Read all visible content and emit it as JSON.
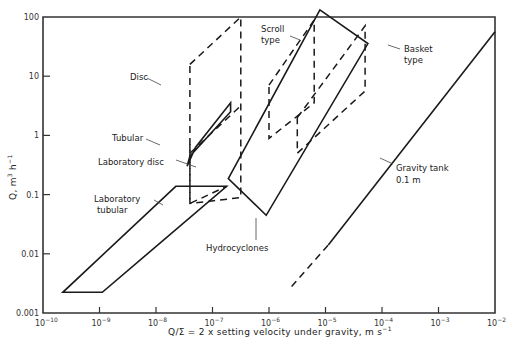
{
  "chart_data": {
    "type": "line",
    "title": "",
    "xlabel": "Q/Σ = 2 x setting velocity under gravity,  m s⁻¹",
    "ylabel": "Q,  m³ h⁻¹",
    "xscale": "log",
    "yscale": "log",
    "xlim": [
      1e-10,
      0.01
    ],
    "ylim": [
      0.001,
      100
    ],
    "grid": false,
    "x_tick_labels": [
      "10⁻¹⁰",
      "10⁻⁹",
      "10⁻⁸",
      "10⁻⁷",
      "10⁻⁶",
      "10⁻⁵",
      "10⁻⁴",
      "10⁻³",
      "10⁻²"
    ],
    "y_tick_labels": [
      "0.001",
      "0.01",
      "0.1",
      "1",
      "10",
      "100"
    ],
    "series": [
      {
        "name": "Laboratory tubular",
        "style": "solid",
        "closed": true,
        "points_log": [
          [
            -9.65,
            -2.65
          ],
          [
            -8.95,
            -2.65
          ],
          [
            -6.75,
            -0.86
          ],
          [
            -7.65,
            -0.86
          ]
        ]
      },
      {
        "name": "Laboratory disc",
        "style": "dashed",
        "closed": false,
        "points_log": [
          [
            -7.4,
            -0.15
          ],
          [
            -7.4,
            -1.15
          ],
          [
            -6.75,
            -0.86
          ]
        ]
      },
      {
        "name": "Hydrocyclones",
        "style": "solid",
        "closed": true,
        "points_log": [
          [
            -6.72,
            -0.73
          ],
          [
            -5.1,
            2.12
          ],
          [
            -4.25,
            1.55
          ],
          [
            -6.05,
            -1.35
          ]
        ]
      },
      {
        "name": "Tubular",
        "style": "solid",
        "closed": true,
        "points_log": [
          [
            -7.45,
            -0.52
          ],
          [
            -7.3,
            -0.2
          ],
          [
            -6.68,
            0.55
          ],
          [
            -6.68,
            0.4
          ],
          [
            -7.4,
            -0.35
          ],
          [
            -7.45,
            -0.52
          ]
        ]
      },
      {
        "name": "Disc",
        "style": "dashed",
        "closed": true,
        "points_log": [
          [
            -7.4,
            1.2
          ],
          [
            -6.5,
            2.0
          ],
          [
            -6.5,
            -1.05
          ],
          [
            -7.4,
            -1.15
          ]
        ]
      },
      {
        "name": "Disc (inner)",
        "style": "dashed",
        "closed": false,
        "points_log": [
          [
            -7.4,
            -0.3
          ],
          [
            -6.5,
            0.5
          ]
        ]
      },
      {
        "name": "Scroll type",
        "style": "dashed",
        "closed": true,
        "points_log": [
          [
            -6.0,
            0.85
          ],
          [
            -5.2,
            1.95
          ],
          [
            -5.2,
            0.55
          ],
          [
            -6.0,
            -0.05
          ]
        ]
      },
      {
        "name": "Basket type",
        "style": "dashed",
        "closed": true,
        "points_log": [
          [
            -5.5,
            0.3
          ],
          [
            -4.3,
            1.85
          ],
          [
            -4.3,
            0.75
          ],
          [
            -5.5,
            -0.3
          ]
        ]
      },
      {
        "name": "Gravity tank 0.1 m",
        "style": "solid",
        "closed": false,
        "points_log": [
          [
            -4.95,
            -1.85
          ],
          [
            -2.0,
            1.75
          ]
        ]
      },
      {
        "name": "Gravity tank 0.1 m (extension)",
        "style": "dashed",
        "closed": false,
        "points_log": [
          [
            -5.6,
            -2.55
          ],
          [
            -4.95,
            -1.85
          ]
        ]
      }
    ],
    "annotations": [
      {
        "text": "Disc",
        "x": 130,
        "y": 80,
        "lx1": 147,
        "ly1": 78,
        "lx2": 161,
        "ly2": 85
      },
      {
        "text": "Tubular",
        "x": 112,
        "y": 141,
        "lx1": 146,
        "ly1": 139,
        "lx2": 160,
        "ly2": 145
      },
      {
        "text": "Laboratory disc",
        "x": 98,
        "y": 165,
        "lx1": 176,
        "ly1": 160,
        "lx2": 196,
        "ly2": 167
      },
      {
        "text": "Laboratory",
        "x": 94,
        "y": 202,
        "lx1": 154,
        "ly1": 200,
        "lx2": 163,
        "ly2": 205
      },
      {
        "text": "tubular",
        "x": 97,
        "y": 213
      },
      {
        "text": "Hydrocyclones",
        "x": 206,
        "y": 251,
        "lx1": 256,
        "ly1": 218,
        "lx2": 256,
        "ly2": 240
      },
      {
        "text": "Scroll",
        "x": 261,
        "y": 32
      },
      {
        "text": "type",
        "x": 261,
        "y": 43,
        "lx1": 290,
        "ly1": 36,
        "lx2": 300,
        "ly2": 40
      },
      {
        "text": "Basket",
        "x": 404,
        "y": 52
      },
      {
        "text": "type",
        "x": 404,
        "y": 63,
        "lx1": 388,
        "ly1": 45,
        "lx2": 400,
        "ly2": 49
      },
      {
        "text": "Gravity tank",
        "x": 396,
        "y": 171,
        "lx1": 380,
        "ly1": 158,
        "lx2": 393,
        "ly2": 164
      },
      {
        "text": "0.1 m",
        "x": 396,
        "y": 183
      }
    ]
  },
  "axes": {
    "x_title": "Q/Σ = 2 x setting velocity under gravity,  m s",
    "x_title_sup": "−1",
    "y_title": "Q,  m",
    "y_title_sup": "3",
    "y_title_tail": " h",
    "y_title_tail_sup": "−1",
    "x_ticks": [
      {
        "base": "10",
        "exp": "−10"
      },
      {
        "base": "10",
        "exp": "−9"
      },
      {
        "base": "10",
        "exp": "−8"
      },
      {
        "base": "10",
        "exp": "−7"
      },
      {
        "base": "10",
        "exp": "−6"
      },
      {
        "base": "10",
        "exp": "−5"
      },
      {
        "base": "10",
        "exp": "−4"
      },
      {
        "base": "10",
        "exp": "−3"
      },
      {
        "base": "10",
        "exp": "−2"
      }
    ],
    "y_ticks": [
      "0.001",
      "0.01",
      "0.1",
      "1",
      "10",
      "100"
    ]
  },
  "layout": {
    "x0": 43,
    "x1": 495,
    "y_top": 17,
    "y_bot": 313,
    "xmin_exp": -10,
    "xmax_exp": -2,
    "ymin_exp": -3,
    "ymax_exp": 2
  }
}
